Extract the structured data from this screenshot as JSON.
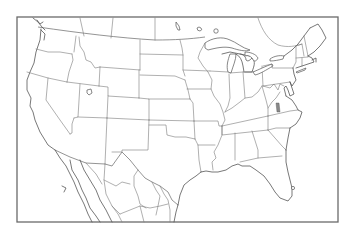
{
  "map": {
    "type": "blank outline map",
    "region": "Contiguous United States with surrounding Canada and northern Mexico",
    "labels": [],
    "frame": {
      "x": 17,
      "y": 17,
      "width": 321,
      "height": 205
    },
    "colors": {
      "background": "#ffffff",
      "frame": "#6a6a6a",
      "borders": "#7a7a7a",
      "coastline": "#555555",
      "highlight_marker": "#888888"
    },
    "features": [
      "state-borders",
      "great-lakes",
      "great-salt-lake",
      "lake-okeechobee",
      "mexico-state-borders",
      "canada-province-borders"
    ],
    "highlight_marker": {
      "description": "small shaded mark in western Virginia",
      "x": 278,
      "y": 108
    }
  }
}
